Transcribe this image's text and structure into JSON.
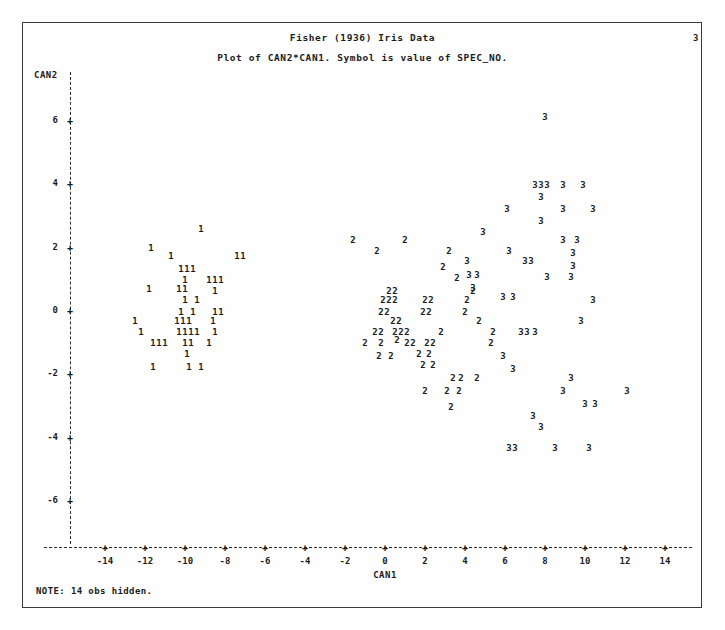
{
  "page": {
    "page_number": "3",
    "note": "NOTE: 14 obs hidden."
  },
  "titles": {
    "line1": "Fisher (1936) Iris Data",
    "line2": "Plot of CAN2*CAN1.  Symbol is value of SPEC_NO."
  },
  "axes": {
    "x_title": "CAN1",
    "y_title": "CAN2",
    "x_ticks": [
      "-14",
      "-12",
      "-10",
      "-8",
      "-6",
      "-4",
      "-2",
      "0",
      "2",
      "4",
      "6",
      "8",
      "10",
      "12",
      "14"
    ],
    "y_ticks": [
      "6",
      "4",
      "2",
      "0",
      "-2",
      "-4",
      "-6"
    ],
    "tick_mark_glyph": "+",
    "x_range": [
      -15.5,
      16.0
    ],
    "y_range": [
      -7.1,
      7.1
    ]
  },
  "chart_data": {
    "type": "scatter",
    "title": "Fisher (1936) Iris Data",
    "subtitle": "Plot of CAN2*CAN1.  Symbol is value of SPEC_NO.",
    "xlabel": "CAN1",
    "ylabel": "CAN2",
    "xlim": [
      -15.5,
      16.0
    ],
    "ylim": [
      -7.1,
      7.1
    ],
    "grid": false,
    "legend": "none",
    "symbol_meaning": "Symbol is value of SPEC_NO.",
    "note": "NOTE: 14 obs hidden.",
    "series": [
      {
        "name": "1",
        "symbol": "1",
        "points": [
          [
            -9.2,
            2.55
          ],
          [
            -11.7,
            1.95
          ],
          [
            -10.7,
            1.7
          ],
          [
            -7.4,
            1.7
          ],
          [
            -7.1,
            1.7
          ],
          [
            -10.2,
            1.3
          ],
          [
            -9.9,
            1.3
          ],
          [
            -9.6,
            1.3
          ],
          [
            -10.0,
            0.95
          ],
          [
            -11.8,
            0.65
          ],
          [
            -10.3,
            0.65
          ],
          [
            -10.0,
            0.65
          ],
          [
            -8.8,
            0.95
          ],
          [
            -8.5,
            0.95
          ],
          [
            -8.2,
            0.95
          ],
          [
            -8.5,
            0.6
          ],
          [
            -10.0,
            0.3
          ],
          [
            -9.4,
            0.3
          ],
          [
            -10.2,
            -0.05
          ],
          [
            -9.6,
            -0.05
          ],
          [
            -8.5,
            -0.05
          ],
          [
            -8.2,
            -0.05
          ],
          [
            -12.5,
            -0.35
          ],
          [
            -10.4,
            -0.35
          ],
          [
            -10.1,
            -0.35
          ],
          [
            -9.8,
            -0.35
          ],
          [
            -8.6,
            -0.35
          ],
          [
            -12.2,
            -0.7
          ],
          [
            -10.3,
            -0.7
          ],
          [
            -10.0,
            -0.7
          ],
          [
            -9.7,
            -0.7
          ],
          [
            -9.4,
            -0.7
          ],
          [
            -8.5,
            -0.7
          ],
          [
            -11.6,
            -1.05
          ],
          [
            -11.3,
            -1.05
          ],
          [
            -11.0,
            -1.05
          ],
          [
            -10.0,
            -1.05
          ],
          [
            -9.7,
            -1.05
          ],
          [
            -8.8,
            -1.05
          ],
          [
            -9.9,
            -1.4
          ],
          [
            -11.6,
            -1.8
          ],
          [
            -9.8,
            -1.8
          ],
          [
            -9.2,
            -1.8
          ]
        ]
      },
      {
        "name": "2",
        "symbol": "2",
        "points": [
          [
            -1.6,
            2.2
          ],
          [
            1.0,
            2.2
          ],
          [
            -0.4,
            1.85
          ],
          [
            3.2,
            1.85
          ],
          [
            2.9,
            1.35
          ],
          [
            3.6,
            1.0
          ],
          [
            0.2,
            0.6
          ],
          [
            0.5,
            0.6
          ],
          [
            4.4,
            0.6
          ],
          [
            4.1,
            0.3
          ],
          [
            -0.1,
            0.3
          ],
          [
            0.2,
            0.3
          ],
          [
            0.5,
            0.3
          ],
          [
            2.0,
            0.3
          ],
          [
            2.3,
            0.3
          ],
          [
            -0.2,
            -0.05
          ],
          [
            0.1,
            -0.05
          ],
          [
            1.9,
            -0.05
          ],
          [
            2.2,
            -0.05
          ],
          [
            4.0,
            -0.05
          ],
          [
            0.4,
            -0.35
          ],
          [
            0.7,
            -0.35
          ],
          [
            4.7,
            -0.35
          ],
          [
            1.1,
            -0.7
          ],
          [
            -0.5,
            -0.7
          ],
          [
            -0.2,
            -0.7
          ],
          [
            0.5,
            -0.7
          ],
          [
            0.8,
            -0.7
          ],
          [
            2.8,
            -0.7
          ],
          [
            5.4,
            -0.7
          ],
          [
            -1.0,
            -1.05
          ],
          [
            -0.2,
            -1.05
          ],
          [
            0.6,
            -0.95
          ],
          [
            1.1,
            -1.05
          ],
          [
            1.4,
            -1.05
          ],
          [
            2.1,
            -1.05
          ],
          [
            2.4,
            -1.05
          ],
          [
            5.3,
            -1.05
          ],
          [
            -0.3,
            -1.45
          ],
          [
            0.3,
            -1.45
          ],
          [
            1.7,
            -1.4
          ],
          [
            2.2,
            -1.4
          ],
          [
            1.9,
            -1.75
          ],
          [
            2.4,
            -1.75
          ],
          [
            3.4,
            -2.15
          ],
          [
            3.8,
            -2.15
          ],
          [
            4.6,
            -2.15
          ],
          [
            2.0,
            -2.55
          ],
          [
            3.1,
            -2.55
          ],
          [
            3.7,
            -2.55
          ],
          [
            3.3,
            -3.05
          ]
        ]
      },
      {
        "name": "3",
        "symbol": "3",
        "points": [
          [
            8.0,
            6.1
          ],
          [
            7.5,
            3.95
          ],
          [
            7.8,
            3.95
          ],
          [
            8.1,
            3.95
          ],
          [
            8.9,
            3.95
          ],
          [
            9.9,
            3.95
          ],
          [
            7.8,
            3.55
          ],
          [
            6.1,
            3.2
          ],
          [
            8.9,
            3.2
          ],
          [
            10.4,
            3.2
          ],
          [
            7.8,
            2.8
          ],
          [
            4.9,
            2.45
          ],
          [
            8.9,
            2.2
          ],
          [
            9.6,
            2.2
          ],
          [
            6.2,
            1.85
          ],
          [
            9.4,
            1.8
          ],
          [
            4.1,
            1.55
          ],
          [
            7.0,
            1.55
          ],
          [
            7.3,
            1.55
          ],
          [
            9.4,
            1.4
          ],
          [
            4.2,
            1.1
          ],
          [
            4.6,
            1.1
          ],
          [
            8.1,
            1.05
          ],
          [
            9.3,
            1.05
          ],
          [
            4.4,
            0.7
          ],
          [
            5.9,
            0.4
          ],
          [
            6.4,
            0.4
          ],
          [
            10.4,
            0.3
          ],
          [
            9.8,
            -0.35
          ],
          [
            6.8,
            -0.7
          ],
          [
            7.1,
            -0.7
          ],
          [
            7.5,
            -0.7
          ],
          [
            5.9,
            -1.45
          ],
          [
            6.4,
            -1.85
          ],
          [
            9.3,
            -2.15
          ],
          [
            12.1,
            -2.55
          ],
          [
            8.9,
            -2.55
          ],
          [
            10.0,
            -2.95
          ],
          [
            10.5,
            -2.95
          ],
          [
            7.4,
            -3.35
          ],
          [
            7.8,
            -3.7
          ],
          [
            6.2,
            -4.35
          ],
          [
            6.5,
            -4.35
          ],
          [
            8.5,
            -4.35
          ],
          [
            10.2,
            -4.35
          ]
        ]
      }
    ]
  }
}
